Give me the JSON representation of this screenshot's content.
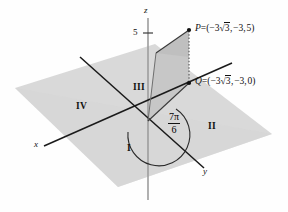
{
  "figure": {
    "axes": {
      "z_label": "z",
      "x_label": "x",
      "y_label": "y",
      "z_tick_label": "5"
    },
    "quadrants": [
      {
        "id": "I",
        "label": "I"
      },
      {
        "id": "II",
        "label": "II"
      },
      {
        "id": "III",
        "label": "III"
      },
      {
        "id": "IV",
        "label": "IV"
      }
    ],
    "points": [
      {
        "id": "P",
        "name": "P",
        "eq": "=",
        "open": "(",
        "neg": "−3",
        "radical": "3",
        "sep1": ",",
        "y": "−3",
        "sep2": ",",
        "z": "5",
        "close": ")",
        "full_label": "P = (−3√3, −3, 5)"
      },
      {
        "id": "Q",
        "name": "Q",
        "eq": "=",
        "open": "(",
        "neg": "−3",
        "radical": "3",
        "sep1": ",",
        "y": "−3",
        "sep2": ",",
        "z": "0",
        "close": ")",
        "full_label": "Q = (−3√3, −3, 0)"
      }
    ],
    "angle": {
      "numerator": "7π",
      "denominator": "6",
      "full_label": "7π/6"
    },
    "colors": {
      "plane_fill": "#d9d9d9",
      "plane_fill_front": "#d2d2d2",
      "vertical_quad_fill": "#c9c9c9",
      "vertical_quad_fill_upper": "#bfbfbf",
      "stroke": "#1a1a1a",
      "axis_gray": "#9a9a9a",
      "background": "#fefefe"
    }
  }
}
